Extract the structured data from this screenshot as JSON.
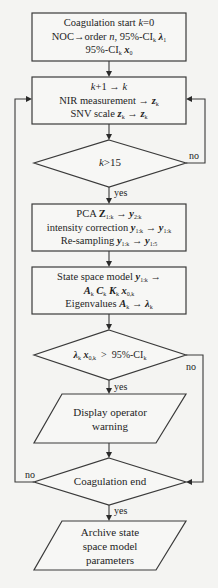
{
  "diagram": {
    "type": "flowchart",
    "nodes": [
      {
        "id": "start",
        "shape": "rectangle",
        "lines": [
          "Coagulation start k=0",
          "NOC→order n, 95%-CI_k λ_1",
          "95%-CI_k x_0"
        ]
      },
      {
        "id": "measure",
        "shape": "rectangle",
        "lines": [
          "k+1 → k",
          "NIR measurement → z_k",
          "SNV scale z_k → z_k"
        ]
      },
      {
        "id": "check_k",
        "shape": "diamond",
        "lines": [
          "k>15"
        ]
      },
      {
        "id": "preprocess",
        "shape": "rectangle",
        "lines": [
          "PCA Z_1:k → y_2:k",
          "intensity correction y_1:k → y_1:k",
          "Re-sampling y_1:k → y_1:5"
        ]
      },
      {
        "id": "model",
        "shape": "rectangle",
        "lines": [
          "State space model y_1:k →",
          "A_k C_k K_k x_0,k",
          "Eigenvalues A_k → λ_k"
        ]
      },
      {
        "id": "check_ci",
        "shape": "diamond",
        "lines": [
          "λ_k x_0,k > 95%-CI_k"
        ]
      },
      {
        "id": "warning",
        "shape": "parallelogram",
        "lines": [
          "Display operator",
          "warning"
        ]
      },
      {
        "id": "check_end",
        "shape": "diamond",
        "lines": [
          "Coagulation end"
        ]
      },
      {
        "id": "archive",
        "shape": "parallelogram",
        "lines": [
          "Archive state",
          "space model",
          "parameters"
        ]
      }
    ],
    "edges": [
      {
        "from": "start",
        "to": "measure",
        "label": ""
      },
      {
        "from": "measure",
        "to": "check_k",
        "label": ""
      },
      {
        "from": "check_k",
        "to": "preprocess",
        "label": "yes"
      },
      {
        "from": "check_k",
        "to": "measure",
        "label": "no"
      },
      {
        "from": "preprocess",
        "to": "model",
        "label": ""
      },
      {
        "from": "model",
        "to": "check_ci",
        "label": ""
      },
      {
        "from": "check_ci",
        "to": "warning",
        "label": "yes"
      },
      {
        "from": "check_ci",
        "to": "check_end",
        "label": "no"
      },
      {
        "from": "warning",
        "to": "check_end",
        "label": ""
      },
      {
        "from": "check_end",
        "to": "archive",
        "label": "yes"
      },
      {
        "from": "check_end",
        "to": "measure",
        "label": "no"
      }
    ]
  },
  "text": {
    "start_l1_a": "Coagulation start ",
    "start_l1_k": "k",
    "start_l1_b": "=0",
    "start_l2_a": "NOC→order ",
    "start_l2_n": "n",
    "start_l2_b": ", 95%-CI",
    "start_l2_sub": "k",
    "start_l2_lam": "λ",
    "start_l2_lamsub": "1",
    "start_l3_a": "95%-CI",
    "start_l3_sub": "k",
    "start_l3_x": "x",
    "start_l3_xsub": "0",
    "meas_l1_k": "k",
    "meas_l1_b": "+1 → ",
    "meas_l1_k2": "k",
    "meas_l2_a": "NIR measurement → ",
    "meas_l2_z": "z",
    "meas_l2_sub": "k",
    "meas_l3_a": "SNV scale ",
    "meas_l3_z": "z",
    "meas_l3_sub": "k",
    "meas_l3_arrow": " → ",
    "meas_l3_z2": "z",
    "meas_l3_sub2": "k",
    "ck_k": "k",
    "ck_b": ">15",
    "pca_l1_a": "PCA ",
    "pca_l1_Z": "Z",
    "pca_l1_Zsub": "1:k",
    "pca_l1_arrow": " → ",
    "pca_l1_y": "y",
    "pca_l1_ysub": "2:k",
    "pca_l2_a": "intensity correction ",
    "pca_l2_y": "y",
    "pca_l2_ysub": "1:k",
    "pca_l2_arrow": " → ",
    "pca_l2_y2": "y",
    "pca_l2_y2sub": "1:k",
    "pca_l3_a": "Re-sampling ",
    "pca_l3_y": "y",
    "pca_l3_ysub": "1:k",
    "pca_l3_arrow": " → ",
    "pca_l3_y2": "y",
    "pca_l3_y2sub": "1:5",
    "ssm_l1_a": "State space model ",
    "ssm_l1_y": "y",
    "ssm_l1_ysub": "1:k",
    "ssm_l1_arrow": " →",
    "ssm_l2_A": "A",
    "ssm_l2_Asub": "k",
    "ssm_l2_C": "C",
    "ssm_l2_Csub": "k",
    "ssm_l2_K": "K",
    "ssm_l2_Ksub": "k",
    "ssm_l2_x": "x",
    "ssm_l2_xsub": "0,k",
    "ssm_l3_a": "Eigenvalues ",
    "ssm_l3_A": "A",
    "ssm_l3_Asub": "k",
    "ssm_l3_arrow": " → ",
    "ssm_l3_lam": "λ",
    "ssm_l3_lamsub": "k",
    "ci_lam": "λ",
    "ci_lamsub": "k",
    "ci_x": "x",
    "ci_xsub": "0,k",
    "ci_b": "  >  95%-CI",
    "ci_sub": "k",
    "warn_l1": "Display operator",
    "warn_l2": "warning",
    "end_l1": "Coagulation end",
    "arch_l1": "Archive state",
    "arch_l2": "space model",
    "arch_l3": "parameters",
    "yes": "yes",
    "no": "no"
  }
}
